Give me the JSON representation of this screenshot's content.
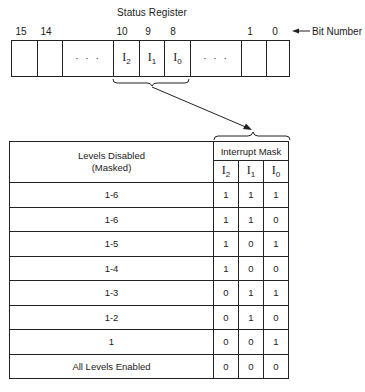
{
  "register": {
    "title": "Status Register",
    "bit_number_label": "Bit Number",
    "bit_numbers": [
      {
        "label": "15",
        "x": 14
      },
      {
        "label": "14",
        "x": 39
      },
      {
        "label": "10",
        "x": 115
      },
      {
        "label": "9",
        "x": 141
      },
      {
        "label": "8",
        "x": 166
      },
      {
        "label": "1",
        "x": 243
      },
      {
        "label": "0",
        "x": 268
      }
    ],
    "cells": [
      {
        "content": "",
        "left": 0,
        "width": 25
      },
      {
        "content": "",
        "left": 25,
        "width": 25
      },
      {
        "content": "· · ·",
        "left": 50,
        "width": 51,
        "kind": "dots"
      },
      {
        "content": "I",
        "sub": "2",
        "left": 101,
        "width": 26,
        "kind": "field"
      },
      {
        "content": "I",
        "sub": "1",
        "left": 127,
        "width": 25,
        "kind": "field"
      },
      {
        "content": "I",
        "sub": "0",
        "left": 152,
        "width": 26,
        "kind": "field"
      },
      {
        "content": "· · ·",
        "left": 178,
        "width": 51,
        "kind": "dots"
      },
      {
        "content": "",
        "left": 229,
        "width": 25
      },
      {
        "content": "",
        "left": 254,
        "width": 25
      }
    ]
  },
  "table": {
    "header": {
      "levels_line1": "Levels Disabled",
      "levels_line2": "(Masked)",
      "mask_title": "Interrupt Mask",
      "bits": [
        {
          "base": "I",
          "sub": "2"
        },
        {
          "base": "I",
          "sub": "1"
        },
        {
          "base": "I",
          "sub": "0"
        }
      ]
    },
    "rows": [
      {
        "levels": "1-6",
        "i2": "1",
        "i1": "1",
        "i0": "1"
      },
      {
        "levels": "1-6",
        "i2": "1",
        "i1": "1",
        "i0": "0"
      },
      {
        "levels": "1-5",
        "i2": "1",
        "i1": "0",
        "i0": "1"
      },
      {
        "levels": "1-4",
        "i2": "1",
        "i1": "0",
        "i0": "0"
      },
      {
        "levels": "1-3",
        "i2": "0",
        "i1": "1",
        "i0": "1"
      },
      {
        "levels": "1-2",
        "i2": "0",
        "i1": "1",
        "i0": "0"
      },
      {
        "levels": "1",
        "i2": "0",
        "i1": "0",
        "i0": "1"
      },
      {
        "levels": "All Levels Enabled",
        "i2": "0",
        "i1": "0",
        "i0": "0"
      }
    ]
  }
}
